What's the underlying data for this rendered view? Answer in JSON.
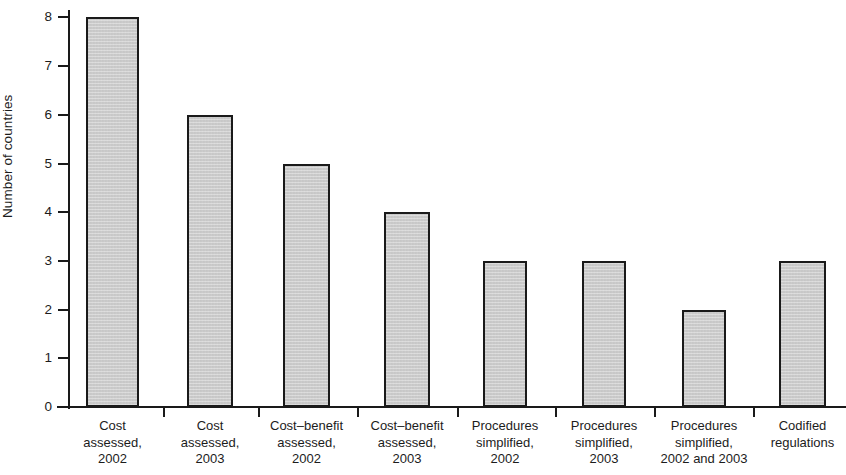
{
  "chart_data": {
    "type": "bar",
    "title": "",
    "xlabel": "",
    "ylabel": "Number of countries",
    "ylim": [
      0,
      8
    ],
    "ytick_labels": [
      "0",
      "1",
      "2",
      "3",
      "4",
      "5",
      "6",
      "7",
      "8"
    ],
    "yticks": [
      0,
      1,
      2,
      3,
      4,
      5,
      6,
      7,
      8
    ],
    "grid": false,
    "legend": null,
    "bar_fill_color": "#c9c9c9",
    "bar_edge_color": "#1a1a1a",
    "categories": [
      "Cost assessed, 2002",
      "Cost assessed, 2003",
      "Cost–benefit assessed, 2002",
      "Cost–benefit assessed, 2003",
      "Procedures simplified, 2002",
      "Procedures simplified, 2003",
      "Procedures simplified, 2002 and 2003",
      "Codified regulations"
    ],
    "category_lines": [
      [
        "Cost",
        "assessed,",
        "2002"
      ],
      [
        "Cost",
        "assessed,",
        "2003"
      ],
      [
        "Cost–benefit",
        "assessed,",
        "2002"
      ],
      [
        "Cost–benefit",
        "assessed,",
        "2003"
      ],
      [
        "Procedures",
        "simplified,",
        "2002"
      ],
      [
        "Procedures",
        "simplified,",
        "2003"
      ],
      [
        "Procedures",
        "simplified,",
        "2002 and 2003"
      ],
      [
        "Codified",
        "regulations"
      ]
    ],
    "values": [
      8,
      6,
      5,
      4,
      3,
      3,
      2,
      3
    ]
  }
}
